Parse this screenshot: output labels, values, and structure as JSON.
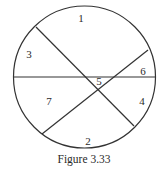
{
  "figure": {
    "caption": "Figure 3.33",
    "stroke_color": "#333333",
    "text_color": "#2a2a2a",
    "background": "#ffffff",
    "circle": {
      "cx": 84.5,
      "cy": 77,
      "r": 71
    },
    "chords": [
      {
        "name": "horizontal-chord",
        "x1": 13.5,
        "y1": 77,
        "x2": 155.5,
        "y2": 77
      },
      {
        "name": "descending-chord",
        "x1": 36,
        "y1": 27,
        "x2": 134,
        "y2": 126
      },
      {
        "name": "ascending-chord",
        "x1": 148,
        "y1": 50,
        "x2": 42,
        "y2": 134
      }
    ],
    "regions": [
      {
        "label": "1",
        "x": 81,
        "y": 22
      },
      {
        "label": "2",
        "x": 88,
        "y": 145
      },
      {
        "label": "3",
        "x": 29,
        "y": 58
      },
      {
        "label": "4",
        "x": 142,
        "y": 105
      },
      {
        "label": "5",
        "x": 99,
        "y": 85
      },
      {
        "label": "6",
        "x": 143,
        "y": 75
      },
      {
        "label": "7",
        "x": 49,
        "y": 105
      }
    ]
  }
}
